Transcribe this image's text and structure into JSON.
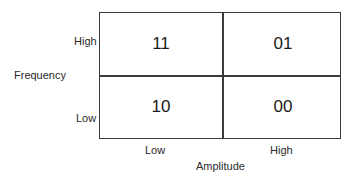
{
  "diagram": {
    "type": "2x2 grid",
    "y_axis": {
      "title": "Frequency",
      "labels": [
        "High",
        "Low"
      ]
    },
    "x_axis": {
      "title": "Amplitude",
      "labels": [
        "Low",
        "High"
      ]
    },
    "cells": [
      {
        "row": "High",
        "col": "Low",
        "value": "11"
      },
      {
        "row": "High",
        "col": "High",
        "value": "01"
      },
      {
        "row": "Low",
        "col": "Low",
        "value": "10"
      },
      {
        "row": "Low",
        "col": "High",
        "value": "00"
      }
    ],
    "colors": {
      "border": "#3a3a3a",
      "text": "#1a1a1a",
      "background": "#ffffff"
    }
  }
}
